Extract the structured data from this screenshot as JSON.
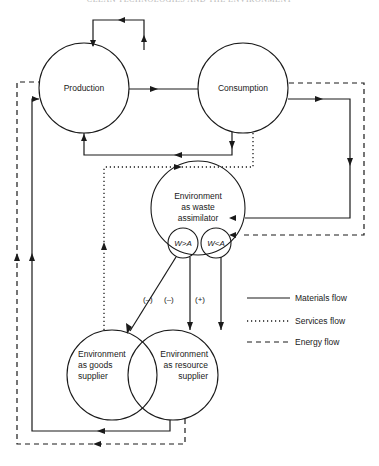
{
  "header": {
    "running_head": "CLEAN TECHNOLOGIES AND THE ENVIRONMENT"
  },
  "nodes": {
    "production": "Production",
    "consumption": "Consumption",
    "waste_assimilator": [
      "Environment",
      "as waste",
      "assimilator"
    ],
    "w_gt_a": "W>A",
    "w_lt_a": "W<A",
    "goods_supplier": [
      "Environment",
      "as goods",
      "supplier"
    ],
    "resource_supplier": [
      "Environment",
      "as resource",
      "supplier"
    ]
  },
  "edge_signs": {
    "w_gt_a_to_goods": "(–)",
    "w_gt_a_to_resource": "(–)",
    "w_lt_a_to_resource": "(+)"
  },
  "legend": {
    "items": [
      {
        "label": "Materials flow",
        "style": "solid"
      },
      {
        "label": "Services flow",
        "style": "dotted"
      },
      {
        "label": "Energy flow",
        "style": "dashed"
      }
    ]
  },
  "colors": {
    "ink": "#1a1a1a",
    "background": "#ffffff"
  }
}
